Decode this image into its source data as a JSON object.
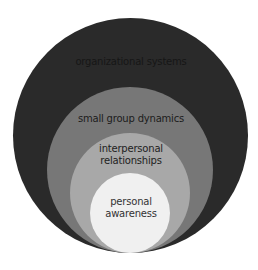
{
  "diagram": {
    "type": "nested-circles",
    "layers": [
      {
        "id": "organizational-systems",
        "label_lines": [
          "organizational systems"
        ],
        "fill": "#2a2a2a",
        "text_color": "#161616"
      },
      {
        "id": "small-group-dynamics",
        "label_lines": [
          "small group dynamics"
        ],
        "fill": "#777777",
        "text_color": "#1c1c1c"
      },
      {
        "id": "interpersonal-relationships",
        "label_lines": [
          "interpersonal",
          "relationships"
        ],
        "fill": "#a8a8a8",
        "text_color": "#1e1e1e"
      },
      {
        "id": "personal-awareness",
        "label_lines": [
          "personal",
          "awareness"
        ],
        "fill": "#f0f0f0",
        "text_color": "#333333"
      }
    ]
  }
}
